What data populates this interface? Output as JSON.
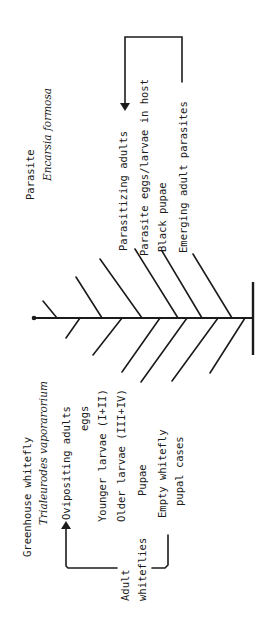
{
  "parasite": {
    "title": "Parasite",
    "species": "Encarsia formosa",
    "stages": [
      {
        "label": "Parasitizing adults"
      },
      {
        "label": "Parasite eggs/larvae in host"
      },
      {
        "label": "Black pupae"
      },
      {
        "label": "Emerging adult parasites"
      }
    ]
  },
  "host": {
    "title": "Greenhouse whitefly",
    "species": "Trialeurodes vaporarorium",
    "stages": [
      {
        "label": "Ovipositing adults"
      },
      {
        "label": "eggs"
      },
      {
        "label": "Younger larvae (I+II)"
      },
      {
        "label": "Older larvae (III+IV)"
      },
      {
        "label": "Pupae"
      },
      {
        "label": "Empty whitefly"
      },
      {
        "label": "pupal cases"
      }
    ],
    "cycle_label_line1": "Adult",
    "cycle_label_line2": "whiteflies"
  },
  "colors": {
    "ink": "#1b1b1b",
    "background": "#ffffff"
  }
}
